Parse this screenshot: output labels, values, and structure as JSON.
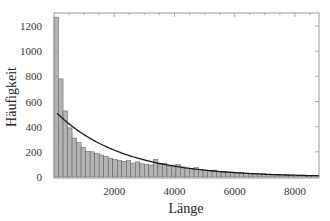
{
  "chart_data": {
    "type": "bar",
    "subtype": "histogram_with_fit_curve",
    "title": "",
    "xlabel": "Länge",
    "ylabel": "Häufigkeit",
    "xlim": [
      0,
      8800
    ],
    "ylim": [
      0,
      1300
    ],
    "xticks": [
      2000,
      4000,
      6000,
      8000
    ],
    "yticks": [
      0,
      200,
      400,
      600,
      800,
      1000,
      1200
    ],
    "grid": false,
    "legend": null,
    "bin_width": 150,
    "bin_start": 0,
    "values": [
      1270,
      780,
      525,
      390,
      310,
      275,
      235,
      205,
      200,
      185,
      175,
      165,
      150,
      140,
      130,
      125,
      130,
      110,
      120,
      105,
      100,
      95,
      140,
      100,
      110,
      85,
      95,
      100,
      80,
      70,
      65,
      75,
      60,
      55,
      50,
      55,
      45,
      45,
      40,
      40,
      35,
      35,
      30,
      30,
      28,
      25,
      25,
      22,
      20,
      20,
      18,
      18,
      16,
      15,
      15,
      14,
      13,
      12,
      12
    ],
    "fit_curve": {
      "type": "exponential",
      "label": "",
      "amplitude": 530,
      "decay_length": 2200,
      "x_start": 100,
      "x_end": 8800
    },
    "colors": {
      "bar_fill": "#b4b4b4",
      "bar_stroke": "#555555",
      "curve": "#1a1a1a",
      "frame": "#999999"
    }
  }
}
